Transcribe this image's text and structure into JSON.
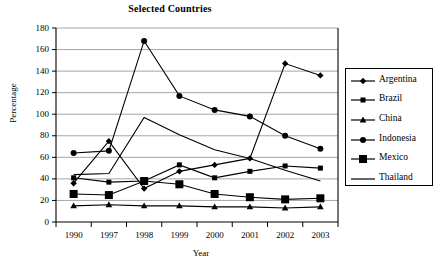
{
  "chart_data": {
    "type": "line",
    "title": "Selected Countries",
    "xlabel": "Year",
    "ylabel": "Percentage",
    "categories": [
      "1990",
      "1997",
      "1998",
      "1999",
      "2000",
      "2001",
      "2002",
      "2003"
    ],
    "ylim": [
      0,
      180
    ],
    "yticks": [
      0,
      20,
      40,
      60,
      80,
      100,
      120,
      140,
      160,
      180
    ],
    "grid": "horizontal",
    "legend_position": "right",
    "series": [
      {
        "name": "Argentina",
        "marker": "diamond-small",
        "values": [
          36,
          75,
          31,
          47,
          53,
          59,
          147,
          136
        ]
      },
      {
        "name": "Brazil",
        "marker": "square-small",
        "values": [
          41,
          37,
          38,
          53,
          41,
          47,
          52,
          50
        ]
      },
      {
        "name": "China",
        "marker": "triangle",
        "values": [
          15,
          16,
          15,
          15,
          14,
          14,
          13,
          14
        ]
      },
      {
        "name": "Indonesia",
        "marker": "circle",
        "values": [
          64,
          66,
          168,
          117,
          104,
          98,
          80,
          68
        ]
      },
      {
        "name": "Mexico",
        "marker": "square-large",
        "values": [
          26,
          25,
          38,
          35,
          26,
          23,
          21,
          22
        ]
      },
      {
        "name": "Thailand",
        "marker": "none",
        "values": [
          44,
          45,
          97,
          81,
          67,
          59,
          48,
          38
        ]
      }
    ]
  },
  "legend": {
    "items": [
      {
        "label": "Argentina"
      },
      {
        "label": "Brazil"
      },
      {
        "label": "China"
      },
      {
        "label": "Indonesia"
      },
      {
        "label": "Mexico"
      },
      {
        "label": "Thailand"
      }
    ]
  },
  "colors": {
    "line": "#000000",
    "grid": "#8f8f8f",
    "axis": "#000000",
    "background": "#ffffff"
  }
}
